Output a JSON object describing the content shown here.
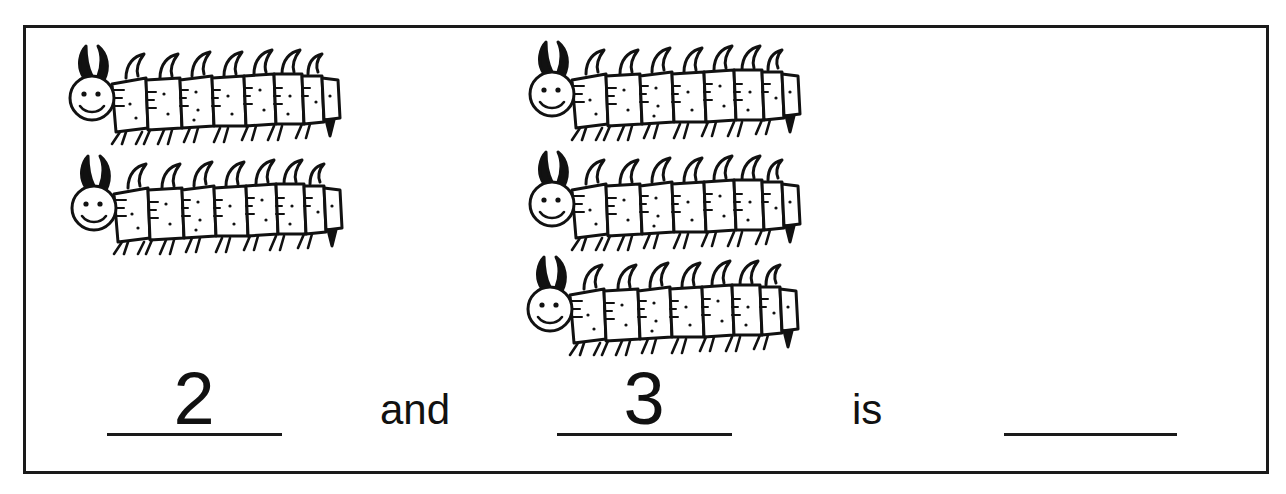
{
  "worksheet": {
    "title": "",
    "groups": [
      {
        "name": "group-a",
        "count": 2,
        "icon": "caterpillar-icon"
      },
      {
        "name": "group-b",
        "count": 3,
        "icon": "caterpillar-icon"
      }
    ],
    "equation": {
      "first_value": "2",
      "connector": "and",
      "second_value": "3",
      "result_label": "is",
      "answer_value": ""
    }
  },
  "colors": {
    "ink": "#111111",
    "paper": "#ffffff"
  }
}
